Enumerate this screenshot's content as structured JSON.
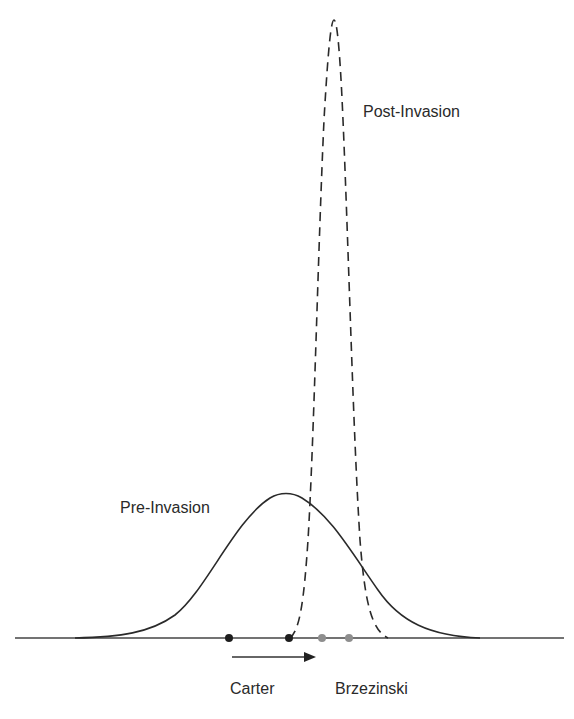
{
  "labels": {
    "post_invasion": "Post-Invasion",
    "pre_invasion": "Pre-Invasion",
    "carter": "Carter",
    "brzezinski": "Brzezinski"
  },
  "colors": {
    "line": "#2a2a2a",
    "dot_black": "#1e1e1e",
    "dot_gray": "#8e8e8e",
    "background": "#ffffff"
  },
  "diagram": {
    "baseline": {
      "x1": 15,
      "x2": 564,
      "y": 638
    },
    "curves": [
      {
        "name": "Pre-Invasion",
        "style": "solid",
        "peak_x": 286,
        "peak_y": 493,
        "left_x": 75,
        "right_x": 480
      },
      {
        "name": "Post-Invasion",
        "style": "dashed",
        "peak_x": 334,
        "peak_y": 20,
        "left_x": 290,
        "right_x": 388
      }
    ],
    "points": [
      {
        "x": 229,
        "color": "black"
      },
      {
        "x": 289,
        "color": "black"
      },
      {
        "x": 322,
        "color": "gray"
      },
      {
        "x": 349,
        "color": "gray"
      }
    ],
    "arrow": {
      "x1": 232,
      "x2": 315,
      "y": 657,
      "direction": "right"
    }
  }
}
